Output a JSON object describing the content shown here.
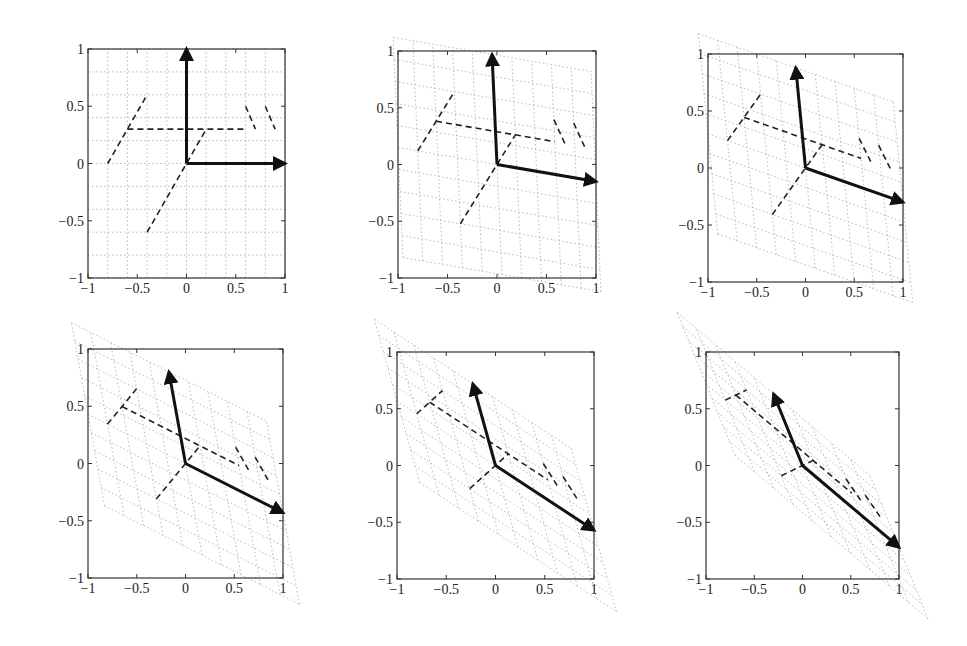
{
  "figure": {
    "layout": "2x3 grid of subplots",
    "axis_tick_labels": [
      "-1",
      "-0.5",
      "0",
      "0.5",
      "1"
    ]
  },
  "chart_data": [
    {
      "type": "line",
      "title": "",
      "xlabel": "",
      "ylabel": "",
      "xlim": [
        -1,
        1
      ],
      "ylim": [
        -1,
        1
      ],
      "xticks": [
        "-1",
        "-0.5",
        "0",
        "0.5",
        "1"
      ],
      "yticks": [
        "-1",
        "-0.5",
        "0",
        "0.5",
        "1"
      ],
      "grid": "dotted (transformed lattice)",
      "box": {
        "left": 88,
        "right": 285,
        "top": 49,
        "bottom": 278
      },
      "matrix": [
        [
          1,
          0
        ],
        [
          0,
          1
        ]
      ],
      "basis_arrows": [
        {
          "from": [
            0,
            0
          ],
          "to": [
            1.0,
            0.0
          ]
        },
        {
          "from": [
            0,
            0
          ],
          "to": [
            0.0,
            1.0
          ]
        }
      ],
      "dashed_figure": [
        [
          [
            -0.8,
            0.0
          ],
          [
            -0.6,
            0.3
          ],
          [
            -0.4,
            0.6
          ]
        ],
        [
          [
            -0.6,
            0.3
          ],
          [
            0.6,
            0.3
          ]
        ],
        [
          [
            -0.4,
            -0.6
          ],
          [
            0.0,
            0.0
          ],
          [
            0.2,
            0.3
          ]
        ],
        [
          [
            0.6,
            0.5
          ],
          [
            0.7,
            0.3
          ]
        ],
        [
          [
            0.8,
            0.5
          ],
          [
            0.9,
            0.3
          ]
        ]
      ]
    },
    {
      "type": "line",
      "xlim": [
        -1,
        1
      ],
      "ylim": [
        -1,
        1
      ],
      "xticks": [
        "-1",
        "-0.5",
        "0",
        "0.5",
        "1"
      ],
      "yticks": [
        "-1",
        "-0.5",
        "0",
        "0.5",
        "1"
      ],
      "box": {
        "left": 398,
        "right": 596,
        "top": 51,
        "bottom": 278
      },
      "matrix": [
        [
          1.0,
          -0.05
        ],
        [
          -0.15,
          0.97
        ]
      ],
      "basis_arrows": [
        {
          "from": [
            0,
            0
          ],
          "to": [
            1.0,
            -0.15
          ]
        },
        {
          "from": [
            0,
            0
          ],
          "to": [
            -0.05,
            0.97
          ]
        }
      ]
    },
    {
      "type": "line",
      "xlim": [
        -1,
        1
      ],
      "ylim": [
        -1,
        1
      ],
      "xticks": [
        "-1",
        "-0.5",
        "0",
        "0.5",
        "1"
      ],
      "yticks": [
        "-1",
        "-0.5",
        "0",
        "0.5",
        "1"
      ],
      "box": {
        "left": 708,
        "right": 903,
        "top": 54,
        "bottom": 282
      },
      "matrix": [
        [
          1.0,
          -0.1
        ],
        [
          -0.3,
          0.88
        ]
      ],
      "basis_arrows": [
        {
          "from": [
            0,
            0
          ],
          "to": [
            1.0,
            -0.3
          ]
        },
        {
          "from": [
            0,
            0
          ],
          "to": [
            -0.1,
            0.88
          ]
        }
      ]
    },
    {
      "type": "line",
      "xlim": [
        -1,
        1
      ],
      "ylim": [
        -1,
        1
      ],
      "xticks": [
        "-1",
        "-0.5",
        "0",
        "0.5",
        "1"
      ],
      "yticks": [
        "-1",
        "-0.5",
        "0",
        "0.5",
        "1"
      ],
      "box": {
        "left": 88,
        "right": 283,
        "top": 349,
        "bottom": 578
      },
      "matrix": [
        [
          1.0,
          -0.17
        ],
        [
          -0.43,
          0.8
        ]
      ],
      "basis_arrows": [
        {
          "from": [
            0,
            0
          ],
          "to": [
            1.0,
            -0.43
          ]
        },
        {
          "from": [
            0,
            0
          ],
          "to": [
            -0.17,
            0.8
          ]
        }
      ]
    },
    {
      "type": "line",
      "xlim": [
        -1,
        1
      ],
      "ylim": [
        -1,
        1
      ],
      "xticks": [
        "-1",
        "-0.5",
        "0",
        "0.5",
        "1"
      ],
      "yticks": [
        "-1",
        "-0.5",
        "0",
        "0.5",
        "1"
      ],
      "box": {
        "left": 397,
        "right": 594,
        "top": 352,
        "bottom": 579
      },
      "matrix": [
        [
          1.0,
          -0.23
        ],
        [
          -0.57,
          0.72
        ]
      ],
      "basis_arrows": [
        {
          "from": [
            0,
            0
          ],
          "to": [
            1.0,
            -0.57
          ]
        },
        {
          "from": [
            0,
            0
          ],
          "to": [
            -0.23,
            0.72
          ]
        }
      ]
    },
    {
      "type": "line",
      "xlim": [
        -1,
        1
      ],
      "ylim": [
        -1,
        1
      ],
      "xticks": [
        "-1",
        "-0.5",
        "0",
        "0.5",
        "1"
      ],
      "yticks": [
        "-1",
        "-0.5",
        "0",
        "0.5",
        "1"
      ],
      "box": {
        "left": 706,
        "right": 899,
        "top": 352,
        "bottom": 579
      },
      "matrix": [
        [
          1.0,
          -0.3
        ],
        [
          -0.72,
          0.63
        ]
      ],
      "basis_arrows": [
        {
          "from": [
            0,
            0
          ],
          "to": [
            1.0,
            -0.72
          ]
        },
        {
          "from": [
            0,
            0
          ],
          "to": [
            -0.3,
            0.63
          ]
        }
      ]
    }
  ]
}
